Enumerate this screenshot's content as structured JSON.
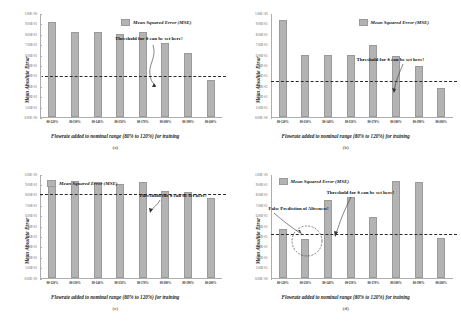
{
  "figure": {
    "panels": [
      "a",
      "b",
      "c",
      "d"
    ],
    "legend_label": "Mean Squared Error (MSE)",
    "threshold_annotation": "Threshold for δ can be set here!",
    "false_prediction_annotation": "False Prediction of Aliveness!",
    "xlabel": "Flowrate added to nominal range (80% to 120%) for training",
    "ylabel": "Mean Absolute Error",
    "panel_captions": {
      "a": "(a)",
      "b": "(b)",
      "c": "(c)",
      "d": "(d)"
    },
    "bar_color": "#b3b3b3",
    "threshold_color": "#2a2a2a"
  },
  "chart_data": [
    {
      "type": "bar",
      "panel": "a",
      "title": "",
      "xlabel": "Flowrate added to nominal range (80% to 120%) for training",
      "ylabel": "Mean Absolute Error",
      "categories": [
        "80-120%",
        "80-130%",
        "80-140%",
        "80-150%",
        "80-170%",
        "80-180%",
        "80-190%",
        "80-200%"
      ],
      "series": [
        {
          "name": "Mean Squared Error (MSE)",
          "values": [
            9.2,
            8.3,
            8.3,
            8.1,
            8.3,
            7.2,
            6.2,
            3.6
          ]
        }
      ],
      "ytick_labels": [
        "0.00E+00",
        "1.00E-01",
        "2.00E-01",
        "3.00E-01",
        "4.00E-01",
        "5.00E-01",
        "6.00E-01",
        "7.00E-01",
        "8.00E-01",
        "9.00E-01",
        "1.00E+00"
      ],
      "ytick_values": [
        0,
        1,
        2,
        3,
        4,
        5,
        6,
        7,
        8,
        9,
        10
      ],
      "ylim": [
        0,
        10
      ],
      "threshold_value": 4.0,
      "grid": false,
      "legend_position": "top-right",
      "annotations": [
        "Threshold for δ can be set here!"
      ]
    },
    {
      "type": "bar",
      "panel": "b",
      "title": "",
      "xlabel": "Flowrate added to nominal range (80% to 120%) for training",
      "ylabel": "Mean Absolute Error",
      "categories": [
        "80-120%",
        "80-130%",
        "80-140%",
        "80-150%",
        "80-170%",
        "80-180%",
        "80-190%",
        "80-200%"
      ],
      "series": [
        {
          "name": "Mean Squared Error (MSE)",
          "values": [
            9.4,
            6.0,
            6.0,
            6.0,
            7.0,
            5.9,
            5.0,
            2.8
          ]
        }
      ],
      "ytick_labels": [
        "0.00E+00",
        "1.00E-01",
        "2.00E-01",
        "3.00E-01",
        "4.00E-01",
        "5.00E-01",
        "6.00E-01",
        "7.00E-01",
        "8.00E-01",
        "9.00E-01",
        "1.00E+00"
      ],
      "ytick_values": [
        0,
        1,
        2,
        3,
        4,
        5,
        6,
        7,
        8,
        9,
        10
      ],
      "ylim": [
        0,
        10
      ],
      "threshold_value": 3.6,
      "grid": false,
      "legend_position": "top-right",
      "annotations": [
        "Threshold for δ can be set here!"
      ]
    },
    {
      "type": "bar",
      "panel": "c",
      "title": "",
      "xlabel": "Flowrate added to nominal range (80% to 120%) for training",
      "ylabel": "Mean Absolute Error",
      "categories": [
        "80-120%",
        "80-130%",
        "80-140%",
        "80-150%",
        "80-170%",
        "80-180%",
        "80-190%",
        "80-200%"
      ],
      "series": [
        {
          "name": "Mean Squared Error (MSE)",
          "values": [
            9.1,
            9.4,
            9.3,
            9.1,
            9.3,
            8.4,
            8.3,
            7.7
          ]
        }
      ],
      "ytick_labels": [
        "0.00E+00",
        "1.00E-01",
        "2.00E-01",
        "3.00E-01",
        "4.00E-01",
        "5.00E-01",
        "6.00E-01",
        "7.00E-01",
        "8.00E-01",
        "9.00E-01",
        "1.00E+00"
      ],
      "ytick_values": [
        0,
        1,
        2,
        3,
        4,
        5,
        6,
        7,
        8,
        9,
        10
      ],
      "ylim": [
        0,
        10
      ],
      "threshold_value": 8.1,
      "grid": false,
      "legend_position": "top-left",
      "annotations": [
        "Threshold for δ can be set here!"
      ]
    },
    {
      "type": "bar",
      "panel": "d",
      "title": "",
      "xlabel": "Flowrate added to nominal range (80% to 120%) for training",
      "ylabel": "Mean Absolute Error",
      "categories": [
        "80-120%",
        "80-130%",
        "80-140%",
        "80-150%",
        "80-170%",
        "80-180%",
        "80-190%",
        "80-200%"
      ],
      "series": [
        {
          "name": "Mean Squared Error (MSE)",
          "values": [
            4.7,
            3.7,
            7.5,
            7.8,
            5.9,
            9.4,
            9.3,
            3.8
          ]
        }
      ],
      "ytick_labels": [
        "0.00E+00",
        "1.00E-01",
        "2.00E-01",
        "3.00E-01",
        "4.00E-01",
        "5.00E-01",
        "6.00E-01",
        "7.00E-01",
        "8.00E-01",
        "9.00E-01",
        "1.00E+00"
      ],
      "ytick_values": [
        0,
        1,
        2,
        3,
        4,
        5,
        6,
        7,
        8,
        9,
        10
      ],
      "ylim": [
        0,
        10
      ],
      "threshold_value": 4.3,
      "grid": false,
      "legend_position": "top-left",
      "annotations": [
        "Threshold for δ can be set here!",
        "False Prediction of Aliveness!"
      ]
    }
  ]
}
